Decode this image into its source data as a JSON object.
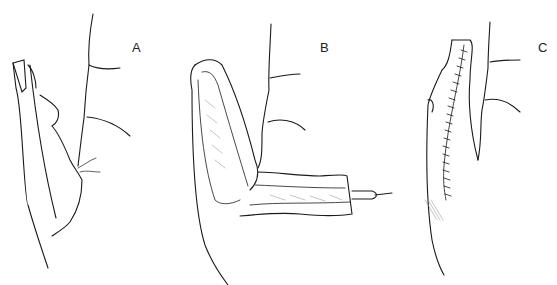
{
  "figure": {
    "panels": [
      {
        "label": "A",
        "description": "Thumb with tip amputation, before flap"
      },
      {
        "label": "B",
        "description": "Flap raised from dorsum and retracted with hook"
      },
      {
        "label": "C",
        "description": "Flap inset with sutured incision line"
      }
    ],
    "signature": "J.C.Ro... '79"
  },
  "colors": {
    "ink": "#1a1a1a",
    "background": "#ffffff",
    "shade": "#8a8a8a"
  }
}
